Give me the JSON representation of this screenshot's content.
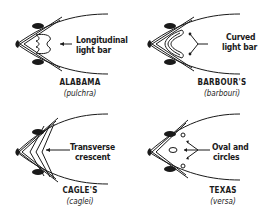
{
  "figure": {
    "panels": [
      {
        "id": "alabama",
        "common_name": "ALABAMA",
        "scientific_name": "(pulchra)",
        "callout": {
          "line1": "Longitudinal",
          "line2": "light bar"
        }
      },
      {
        "id": "barbours",
        "common_name": "BARBOUR'S",
        "scientific_name": "(barbouri)",
        "callout": {
          "line1": "Curved",
          "line2": "light bar"
        }
      },
      {
        "id": "cagles",
        "common_name": "CAGLE'S",
        "scientific_name": "(caglei)",
        "callout": {
          "line1": "Transverse",
          "line2": "crescent"
        }
      },
      {
        "id": "texas",
        "common_name": "TEXAS",
        "scientific_name": "(versa)",
        "callout": {
          "line1": "Oval and",
          "line2": "circles"
        }
      }
    ],
    "colors": {
      "ink": "#1a1a1a",
      "background": "#ffffff"
    }
  }
}
